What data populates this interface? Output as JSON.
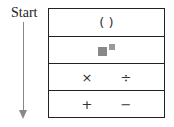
{
  "diagram": {
    "start_label": "Start",
    "rows": [
      {
        "name": "parentheses",
        "symbols": [
          "( )"
        ]
      },
      {
        "name": "exponents",
        "symbols": [
          "exponent-icon"
        ]
      },
      {
        "name": "multiply-divide",
        "symbols": [
          "×",
          "÷"
        ]
      },
      {
        "name": "add-subtract",
        "symbols": [
          "+",
          "−"
        ]
      }
    ]
  }
}
